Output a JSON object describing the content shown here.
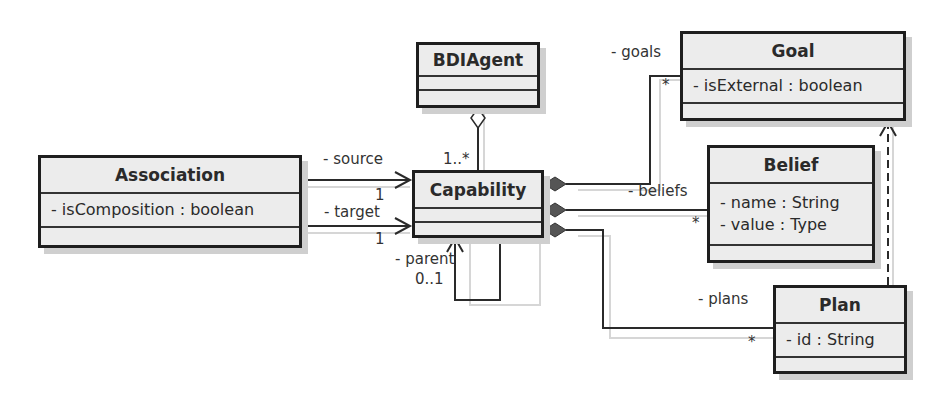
{
  "classes": {
    "bdiagent": {
      "name": "BDIAgent",
      "attributes": []
    },
    "association": {
      "name": "Association",
      "attributes": [
        "- isComposition : boolean"
      ]
    },
    "capability": {
      "name": "Capability",
      "attributes": []
    },
    "goal": {
      "name": "Goal",
      "attributes": [
        "- isExternal : boolean"
      ]
    },
    "belief": {
      "name": "Belief",
      "attributes": [
        "- name : String",
        "- value : Type"
      ]
    },
    "plan": {
      "name": "Plan",
      "attributes": [
        "- id : String"
      ]
    }
  },
  "labels": {
    "source": "- source",
    "source_mult": "1",
    "target": "- target",
    "target_mult": "1",
    "parent": "- parent",
    "parent_mult": "0..1",
    "agent_mult": "1..*",
    "goals": "- goals",
    "goals_mult": "*",
    "beliefs": "- beliefs",
    "beliefs_mult": "*",
    "plans": "- plans",
    "plans_mult": "*"
  }
}
